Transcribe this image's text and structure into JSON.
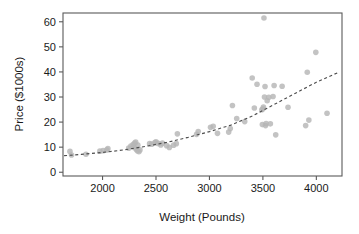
{
  "chart_data": {
    "type": "scatter",
    "title": "",
    "xlabel": "Weight (Pounds)",
    "ylabel": "Price ($1000s)",
    "xlim": [
      1630,
      4240
    ],
    "ylim": [
      -1.5,
      63.5
    ],
    "xticks": [
      2000,
      2500,
      3000,
      3500,
      4000
    ],
    "xtick_labels": [
      "2000",
      "2500",
      "3000",
      "3500",
      "4000"
    ],
    "yticks": [
      0,
      10,
      20,
      30,
      40,
      50,
      60
    ],
    "ytick_labels": [
      "0",
      "10",
      "20",
      "30",
      "40",
      "50",
      "60"
    ],
    "grid": false,
    "legend": null,
    "marker_color": "#b6b6b6",
    "trend_color": "#4d4d4d",
    "frame_color": "#5a5a5a",
    "points": [
      [
        1695,
        8.3
      ],
      [
        1710,
        6.9
      ],
      [
        1845,
        7.2
      ],
      [
        1975,
        8.4
      ],
      [
        2005,
        8.6
      ],
      [
        2040,
        8.9
      ],
      [
        2050,
        9.4
      ],
      [
        2245,
        9.6
      ],
      [
        2265,
        10.4
      ],
      [
        2285,
        11.0
      ],
      [
        2295,
        9.9
      ],
      [
        2300,
        11.6
      ],
      [
        2310,
        12.0
      ],
      [
        2315,
        9.2
      ],
      [
        2325,
        8.6
      ],
      [
        2330,
        10.8
      ],
      [
        2340,
        8.2
      ],
      [
        2350,
        8.9
      ],
      [
        2440,
        11.4
      ],
      [
        2460,
        11.2
      ],
      [
        2490,
        11.8
      ],
      [
        2500,
        12.1
      ],
      [
        2520,
        11.5
      ],
      [
        2545,
        10.9
      ],
      [
        2560,
        11.6
      ],
      [
        2600,
        10.6
      ],
      [
        2625,
        9.9
      ],
      [
        2665,
        10.8
      ],
      [
        2690,
        11.4
      ],
      [
        2700,
        15.3
      ],
      [
        2880,
        15.1
      ],
      [
        2895,
        16.2
      ],
      [
        3010,
        17.9
      ],
      [
        3035,
        18.3
      ],
      [
        3075,
        15.5
      ],
      [
        3180,
        16.0
      ],
      [
        3195,
        17.4
      ],
      [
        3215,
        26.6
      ],
      [
        3255,
        21.4
      ],
      [
        3330,
        20.2
      ],
      [
        3400,
        37.6
      ],
      [
        3420,
        25.6
      ],
      [
        3445,
        35.1
      ],
      [
        3490,
        24.9
      ],
      [
        3495,
        19.0
      ],
      [
        3500,
        25.3
      ],
      [
        3505,
        26.0
      ],
      [
        3510,
        61.5
      ],
      [
        3515,
        30.0
      ],
      [
        3520,
        34.2
      ],
      [
        3525,
        18.6
      ],
      [
        3530,
        19.4
      ],
      [
        3540,
        28.5
      ],
      [
        3555,
        29.9
      ],
      [
        3570,
        19.3
      ],
      [
        3595,
        30.2
      ],
      [
        3605,
        34.6
      ],
      [
        3620,
        14.9
      ],
      [
        3680,
        34.3
      ],
      [
        3735,
        25.9
      ],
      [
        3900,
        18.6
      ],
      [
        3915,
        39.9
      ],
      [
        3930,
        20.8
      ],
      [
        3995,
        47.8
      ],
      [
        4100,
        23.5
      ]
    ],
    "trend_line": {
      "description": "quadratic fitted curve",
      "x": [
        1640,
        1800,
        2000,
        2200,
        2400,
        2600,
        2800,
        3000,
        3200,
        3400,
        3600,
        3800,
        4000,
        4200
      ],
      "y": [
        6.6,
        7.1,
        7.9,
        8.9,
        10.3,
        11.9,
        13.9,
        16.2,
        18.8,
        22.4,
        26.9,
        31.4,
        35.9,
        39.7
      ]
    }
  }
}
